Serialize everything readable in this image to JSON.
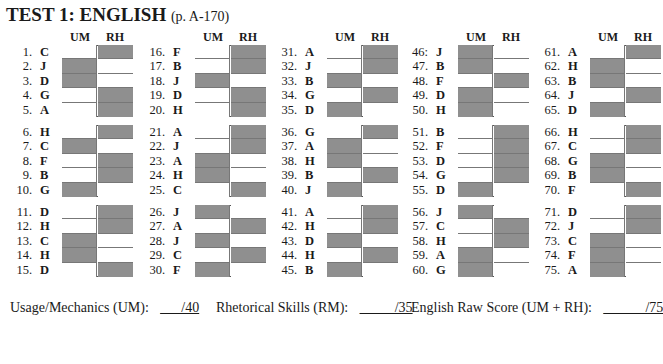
{
  "title": {
    "main": "TEST 1: ENGLISH",
    "page_ref": "(p. A-170)"
  },
  "columns_header": {
    "um": "UM",
    "rh": "RH"
  },
  "shade_color": "#8f8f8f",
  "columns": [
    {
      "items": [
        {
          "n": "1.",
          "a": "C",
          "mark": "RH"
        },
        {
          "n": "2.",
          "a": "J",
          "mark": "UM"
        },
        {
          "n": "3.",
          "a": "D",
          "mark": "UM"
        },
        {
          "n": "4.",
          "a": "G",
          "mark": "RH"
        },
        {
          "n": "5.",
          "a": "A",
          "mark": "RH"
        },
        {
          "n": "6.",
          "a": "H",
          "mark": "RH"
        },
        {
          "n": "7.",
          "a": "C",
          "mark": "UM"
        },
        {
          "n": "8.",
          "a": "F",
          "mark": "RH"
        },
        {
          "n": "9.",
          "a": "B",
          "mark": "RH"
        },
        {
          "n": "10.",
          "a": "G",
          "mark": "UM"
        },
        {
          "n": "11.",
          "a": "D",
          "mark": "RH"
        },
        {
          "n": "12.",
          "a": "H",
          "mark": "RH"
        },
        {
          "n": "13.",
          "a": "C",
          "mark": "UM"
        },
        {
          "n": "14.",
          "a": "H",
          "mark": "UM"
        },
        {
          "n": "15.",
          "a": "D",
          "mark": "RH"
        }
      ]
    },
    {
      "items": [
        {
          "n": "16.",
          "a": "F",
          "mark": "RH"
        },
        {
          "n": "17.",
          "a": "B",
          "mark": "RH"
        },
        {
          "n": "18.",
          "a": "J",
          "mark": "UM"
        },
        {
          "n": "19.",
          "a": "D",
          "mark": "RH"
        },
        {
          "n": "20.",
          "a": "H",
          "mark": "RH"
        },
        {
          "n": "21.",
          "a": "A",
          "mark": "RH"
        },
        {
          "n": "22.",
          "a": "J",
          "mark": "RH"
        },
        {
          "n": "23.",
          "a": "A",
          "mark": "UM"
        },
        {
          "n": "24.",
          "a": "H",
          "mark": "UM"
        },
        {
          "n": "25.",
          "a": "C",
          "mark": "RH"
        },
        {
          "n": "26.",
          "a": "J",
          "mark": "UM"
        },
        {
          "n": "27.",
          "a": "A",
          "mark": "RH"
        },
        {
          "n": "28.",
          "a": "J",
          "mark": "UM"
        },
        {
          "n": "29.",
          "a": "C",
          "mark": "RH"
        },
        {
          "n": "30.",
          "a": "F",
          "mark": "UM"
        }
      ]
    },
    {
      "items": [
        {
          "n": "31.",
          "a": "A",
          "mark": "RH"
        },
        {
          "n": "32.",
          "a": "J",
          "mark": "RH"
        },
        {
          "n": "33.",
          "a": "B",
          "mark": "UM"
        },
        {
          "n": "34.",
          "a": "G",
          "mark": "RH"
        },
        {
          "n": "35.",
          "a": "D",
          "mark": "UM"
        },
        {
          "n": "36.",
          "a": "G",
          "mark": "RH"
        },
        {
          "n": "37.",
          "a": "A",
          "mark": "UM"
        },
        {
          "n": "38.",
          "a": "H",
          "mark": "UM"
        },
        {
          "n": "39.",
          "a": "B",
          "mark": "RH"
        },
        {
          "n": "40.",
          "a": "J",
          "mark": "UM"
        },
        {
          "n": "41.",
          "a": "A",
          "mark": "RH"
        },
        {
          "n": "42.",
          "a": "H",
          "mark": "RH"
        },
        {
          "n": "43.",
          "a": "D",
          "mark": "UM"
        },
        {
          "n": "44.",
          "a": "H",
          "mark": "RH"
        },
        {
          "n": "45.",
          "a": "B",
          "mark": "UM"
        }
      ]
    },
    {
      "items": [
        {
          "n": "46:",
          "a": "J",
          "mark": "UM"
        },
        {
          "n": "47.",
          "a": "B",
          "mark": "UM"
        },
        {
          "n": "48.",
          "a": "F",
          "mark": "RH"
        },
        {
          "n": "49.",
          "a": "D",
          "mark": "UM"
        },
        {
          "n": "50.",
          "a": "H",
          "mark": "UM"
        },
        {
          "n": "51.",
          "a": "B",
          "mark": "RH"
        },
        {
          "n": "52.",
          "a": "F",
          "mark": "RH"
        },
        {
          "n": "53.",
          "a": "D",
          "mark": "RH"
        },
        {
          "n": "54.",
          "a": "G",
          "mark": "RH"
        },
        {
          "n": "55.",
          "a": "D",
          "mark": "UM"
        },
        {
          "n": "56.",
          "a": "J",
          "mark": "UM"
        },
        {
          "n": "57.",
          "a": "C",
          "mark": "RH"
        },
        {
          "n": "58.",
          "a": "H",
          "mark": "RH"
        },
        {
          "n": "59.",
          "a": "A",
          "mark": "UM"
        },
        {
          "n": "60.",
          "a": "G",
          "mark": "UM"
        }
      ]
    },
    {
      "items": [
        {
          "n": "61.",
          "a": "A",
          "mark": "RH"
        },
        {
          "n": "62.",
          "a": "H",
          "mark": "UM"
        },
        {
          "n": "63.",
          "a": "B",
          "mark": "UM"
        },
        {
          "n": "64.",
          "a": "J",
          "mark": "RH"
        },
        {
          "n": "65.",
          "a": "D",
          "mark": "UM"
        },
        {
          "n": "66.",
          "a": "H",
          "mark": "RH"
        },
        {
          "n": "67.",
          "a": "C",
          "mark": "RH"
        },
        {
          "n": "68.",
          "a": "G",
          "mark": "UM"
        },
        {
          "n": "69.",
          "a": "B",
          "mark": "UM"
        },
        {
          "n": "70.",
          "a": "F",
          "mark": "RH"
        },
        {
          "n": "71.",
          "a": "D",
          "mark": "RH"
        },
        {
          "n": "72.",
          "a": "J",
          "mark": "RH"
        },
        {
          "n": "73.",
          "a": "C",
          "mark": "UM"
        },
        {
          "n": "74.",
          "a": "F",
          "mark": "UM"
        },
        {
          "n": "75.",
          "a": "A",
          "mark": "UM"
        }
      ]
    }
  ],
  "footer": {
    "um_label": "Usage/Mechanics (UM):",
    "um_blank": "___/40",
    "rm_label": "Rhetorical Skills (RM):",
    "rm_blank": "_____/35",
    "raw_label": "English Raw Score (UM + RH):",
    "raw_blank": "______/75"
  }
}
